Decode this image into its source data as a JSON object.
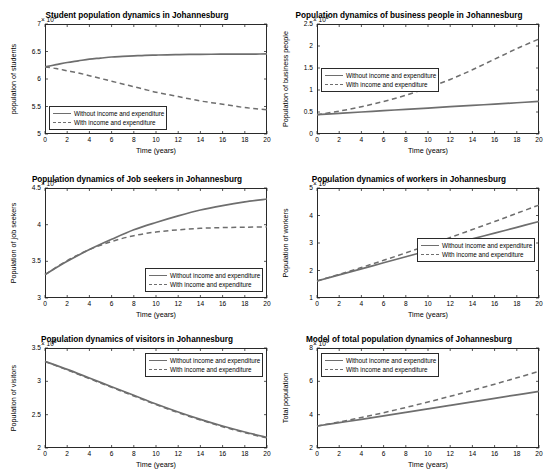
{
  "figure": {
    "background": "#ffffff",
    "line_color": "#6e6e6e",
    "axis_color": "#2a2a2a"
  },
  "legend": {
    "without_label": "Without income and expenditure",
    "with_label": "With income and expenditure"
  },
  "chart_data": [
    {
      "id": "students",
      "type": "line",
      "title": "Student population dynamics in Johannesburg",
      "xlabel": "Time (years)",
      "ylabel": "population of students",
      "y_exponent": "× 10",
      "y_exponent_sup": "5",
      "xlim": [
        0,
        20
      ],
      "ylim": [
        5,
        7
      ],
      "xticks": [
        0,
        2,
        4,
        6,
        8,
        10,
        12,
        14,
        16,
        18,
        20
      ],
      "yticks": [
        5,
        5.5,
        6,
        6.5,
        7
      ],
      "ytick_labels": [
        "5",
        "5.5",
        "6",
        "6.5",
        "7"
      ],
      "grid": false,
      "legend_position": "lower-left",
      "series": [
        {
          "name": "Without income and expenditure",
          "style": "solid",
          "x": [
            0,
            1,
            2,
            3,
            4,
            5,
            6,
            7,
            8,
            9,
            10,
            11,
            12,
            13,
            14,
            15,
            16,
            17,
            18,
            19,
            20
          ],
          "y": [
            6.22,
            6.26,
            6.3,
            6.33,
            6.36,
            6.38,
            6.4,
            6.41,
            6.42,
            6.43,
            6.435,
            6.44,
            6.443,
            6.446,
            6.448,
            6.45,
            6.451,
            6.452,
            6.453,
            6.454,
            6.455
          ]
        },
        {
          "name": "With income and expenditure",
          "style": "dashed",
          "x": [
            0,
            1,
            2,
            3,
            4,
            5,
            6,
            7,
            8,
            9,
            10,
            11,
            12,
            13,
            14,
            15,
            16,
            17,
            18,
            19,
            20
          ],
          "y": [
            6.22,
            6.19,
            6.15,
            6.11,
            6.06,
            6.01,
            5.96,
            5.91,
            5.86,
            5.81,
            5.76,
            5.72,
            5.68,
            5.64,
            5.6,
            5.57,
            5.54,
            5.51,
            5.48,
            5.46,
            5.44
          ]
        }
      ]
    },
    {
      "id": "business-people",
      "type": "line",
      "title": "Population dynamics of business people in Johannesburg",
      "xlabel": "Time (years)",
      "ylabel": "Population of business people",
      "y_exponent": "× 10",
      "y_exponent_sup": "5",
      "xlim": [
        0,
        20
      ],
      "ylim": [
        0,
        2.5
      ],
      "xticks": [
        0,
        2,
        4,
        6,
        8,
        10,
        12,
        14,
        16,
        18,
        20
      ],
      "yticks": [
        0,
        0.5,
        1,
        1.5,
        2,
        2.5
      ],
      "ytick_labels": [
        "0",
        "0.5",
        "1",
        "1.5",
        "2",
        "2.5"
      ],
      "grid": false,
      "legend_position": "middle-left",
      "series": [
        {
          "name": "Without income and expenditure",
          "style": "solid",
          "x": [
            0,
            2,
            4,
            6,
            8,
            10,
            12,
            14,
            16,
            18,
            20
          ],
          "y": [
            0.44,
            0.47,
            0.5,
            0.53,
            0.56,
            0.59,
            0.62,
            0.65,
            0.68,
            0.71,
            0.74
          ]
        },
        {
          "name": "With income and expenditure",
          "style": "dashed",
          "x": [
            0,
            2,
            4,
            6,
            8,
            10,
            12,
            14,
            16,
            18,
            20
          ],
          "y": [
            0.44,
            0.52,
            0.62,
            0.74,
            0.88,
            1.05,
            1.24,
            1.46,
            1.7,
            1.94,
            2.16
          ]
        }
      ]
    },
    {
      "id": "job-seekers",
      "type": "line",
      "title": "Population dynamics of Job seekers in Johannesburg",
      "xlabel": "Time (years)",
      "ylabel": "Population of job seekers",
      "y_exponent": "× 10",
      "y_exponent_sup": "5",
      "xlim": [
        0,
        20
      ],
      "ylim": [
        3,
        4.5
      ],
      "xticks": [
        0,
        2,
        4,
        6,
        8,
        10,
        12,
        14,
        16,
        18,
        20
      ],
      "yticks": [
        3,
        3.5,
        4,
        4.5
      ],
      "ytick_labels": [
        "3",
        "3.5",
        "4",
        "4.5"
      ],
      "grid": false,
      "legend_position": "lower-right",
      "series": [
        {
          "name": "Without income and expenditure",
          "style": "solid",
          "x": [
            0,
            2,
            4,
            6,
            8,
            10,
            12,
            14,
            16,
            18,
            20
          ],
          "y": [
            3.32,
            3.5,
            3.66,
            3.8,
            3.93,
            4.03,
            4.12,
            4.2,
            4.26,
            4.31,
            4.35
          ]
        },
        {
          "name": "With income and expenditure",
          "style": "dashed",
          "x": [
            0,
            2,
            4,
            6,
            8,
            10,
            12,
            14,
            16,
            18,
            20
          ],
          "y": [
            3.32,
            3.51,
            3.66,
            3.77,
            3.85,
            3.9,
            3.93,
            3.95,
            3.96,
            3.965,
            3.97
          ]
        }
      ]
    },
    {
      "id": "workers",
      "type": "line",
      "title": "Population dynamics of workers in Johannesburg",
      "xlabel": "Time (years)",
      "ylabel": "Population of workers",
      "y_exponent": "× 10",
      "y_exponent_sup": "6",
      "xlim": [
        0,
        20
      ],
      "ylim": [
        1,
        5
      ],
      "xticks": [
        0,
        2,
        4,
        6,
        8,
        10,
        12,
        14,
        16,
        18,
        20
      ],
      "yticks": [
        1,
        2,
        3,
        4,
        5
      ],
      "ytick_labels": [
        "1",
        "2",
        "3",
        "4",
        "5"
      ],
      "grid": false,
      "legend_position": "middle-right",
      "series": [
        {
          "name": "Without income and expenditure",
          "style": "solid",
          "x": [
            0,
            2,
            4,
            6,
            8,
            10,
            12,
            14,
            16,
            18,
            20
          ],
          "y": [
            1.62,
            1.84,
            2.06,
            2.28,
            2.5,
            2.72,
            2.94,
            3.15,
            3.36,
            3.57,
            3.78
          ]
        },
        {
          "name": "With income and expenditure",
          "style": "dashed",
          "x": [
            0,
            2,
            4,
            6,
            8,
            10,
            12,
            14,
            16,
            18,
            20
          ],
          "y": [
            1.62,
            1.86,
            2.11,
            2.37,
            2.64,
            2.92,
            3.2,
            3.49,
            3.78,
            4.08,
            4.38
          ]
        }
      ]
    },
    {
      "id": "visitors",
      "type": "line",
      "title": "Population dynamics of visitors in Johannesburg",
      "xlabel": "Time (years)",
      "ylabel": "Population of visitors",
      "y_exponent": "× 10",
      "y_exponent_sup": "5",
      "xlim": [
        0,
        20
      ],
      "ylim": [
        2,
        3.5
      ],
      "xticks": [
        0,
        2,
        4,
        6,
        8,
        10,
        12,
        14,
        16,
        18,
        20
      ],
      "yticks": [
        2,
        2.5,
        3,
        3.5
      ],
      "ytick_labels": [
        "2",
        "2.5",
        "3",
        "3.5"
      ],
      "grid": false,
      "legend_position": "upper-right",
      "series": [
        {
          "name": "Without income and expenditure",
          "style": "solid",
          "x": [
            0,
            2,
            4,
            6,
            8,
            10,
            12,
            14,
            16,
            18,
            20
          ],
          "y": [
            3.3,
            3.18,
            3.05,
            2.92,
            2.79,
            2.66,
            2.54,
            2.43,
            2.33,
            2.24,
            2.16
          ]
        },
        {
          "name": "With income and expenditure",
          "style": "dashed",
          "x": [
            0,
            2,
            4,
            6,
            8,
            10,
            12,
            14,
            16,
            18,
            20
          ],
          "y": [
            3.3,
            3.17,
            3.04,
            2.91,
            2.78,
            2.65,
            2.53,
            2.42,
            2.32,
            2.23,
            2.15
          ]
        }
      ]
    },
    {
      "id": "total-population",
      "type": "line",
      "title": "Model of total population dynamics of Johannesburg",
      "xlabel": "Time (years)",
      "ylabel": "Total population",
      "y_exponent": "× 10",
      "y_exponent_sup": "6",
      "xlim": [
        0,
        20
      ],
      "ylim": [
        2,
        8
      ],
      "xticks": [
        0,
        2,
        4,
        6,
        8,
        10,
        12,
        14,
        16,
        18,
        20
      ],
      "yticks": [
        2,
        4,
        6,
        8
      ],
      "ytick_labels": [
        "2",
        "4",
        "6",
        "8"
      ],
      "grid": false,
      "legend_position": "upper-left",
      "series": [
        {
          "name": "Without income and expenditure",
          "style": "solid",
          "x": [
            0,
            2,
            4,
            6,
            8,
            10,
            12,
            14,
            16,
            18,
            20
          ],
          "y": [
            3.32,
            3.52,
            3.72,
            3.93,
            4.14,
            4.35,
            4.56,
            4.77,
            4.98,
            5.19,
            5.4
          ]
        },
        {
          "name": "With income and expenditure",
          "style": "dashed",
          "x": [
            0,
            2,
            4,
            6,
            8,
            10,
            12,
            14,
            16,
            18,
            20
          ],
          "y": [
            3.32,
            3.56,
            3.83,
            4.12,
            4.43,
            4.76,
            5.1,
            5.46,
            5.83,
            6.21,
            6.6
          ]
        }
      ]
    }
  ]
}
